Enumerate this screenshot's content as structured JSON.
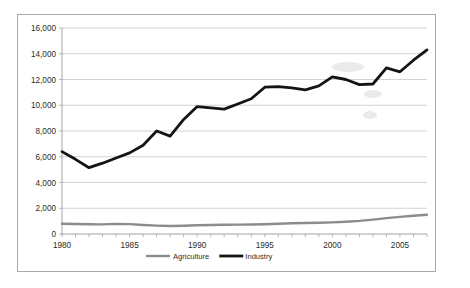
{
  "figure": {
    "background": "#ffffff",
    "border_color": "#a9a9a9"
  },
  "chart_data": {
    "type": "line",
    "title": "",
    "subtitle": "",
    "xlabel": "",
    "ylabel": "",
    "xlim": [
      1980,
      2007
    ],
    "ylim": [
      0,
      16000
    ],
    "grid": true,
    "grid_axis": "y",
    "legend_position": "bottom",
    "x": [
      1980,
      1981,
      1982,
      1983,
      1984,
      1985,
      1986,
      1987,
      1988,
      1989,
      1990,
      1991,
      1992,
      1993,
      1994,
      1995,
      1996,
      1997,
      1998,
      1999,
      2000,
      2001,
      2002,
      2003,
      2004,
      2005,
      2006,
      2007
    ],
    "x_tick_labels": [
      "1980",
      "1985",
      "1990",
      "1995",
      "2000",
      "2005"
    ],
    "x_tick_values": [
      1980,
      1985,
      1990,
      1995,
      2000,
      2005
    ],
    "y_tick_labels": [
      "0",
      "2,000",
      "4,000",
      "6,000",
      "8,000",
      "10,000",
      "12,000",
      "14,000",
      "16,000"
    ],
    "y_tick_values": [
      0,
      2000,
      4000,
      6000,
      8000,
      10000,
      12000,
      14000,
      16000
    ],
    "series": [
      {
        "name": "Agriculture",
        "color": "#8c8c8c",
        "values": [
          800,
          780,
          760,
          750,
          790,
          770,
          700,
          650,
          620,
          640,
          680,
          700,
          720,
          730,
          740,
          760,
          800,
          830,
          850,
          870,
          900,
          950,
          1020,
          1120,
          1230,
          1330,
          1420,
          1500
        ]
      },
      {
        "name": "Industry",
        "color": "#141414",
        "values": [
          6400,
          5800,
          5150,
          5500,
          5900,
          6300,
          6900,
          8000,
          7600,
          8900,
          9900,
          9800,
          9700,
          10100,
          10500,
          11400,
          11450,
          11350,
          11200,
          11500,
          12200,
          12000,
          11600,
          11650,
          12900,
          12600,
          13500,
          14300
        ]
      }
    ],
    "legend": [
      {
        "label": "Agriculture",
        "color": "#8c8c8c"
      },
      {
        "label": "Industry",
        "color": "#141414"
      }
    ]
  }
}
